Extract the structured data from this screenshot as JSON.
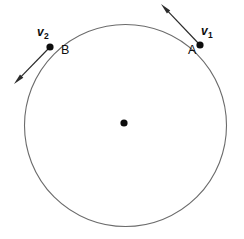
{
  "figure": {
    "background_color": "#ffffff",
    "stroke_color": "#6b6b6b",
    "marker_color": "#0d0d0d",
    "width": 244,
    "height": 239
  },
  "circle": {
    "name": "circular-path",
    "center_x": 125.5,
    "center_y": 125.5,
    "radius": 101,
    "stroke_width": 1.1,
    "stroke_color": "#6b6b6b",
    "fill": "none"
  },
  "center_point": {
    "label": "",
    "x": 124,
    "y": 123,
    "radius": 3.6,
    "color": "#0d0d0d"
  },
  "points": [
    {
      "id": "A",
      "label": "A",
      "x": 200,
      "y": 45,
      "radius": 3.6,
      "color": "#0d0d0d",
      "label_x": 188,
      "label_y": 44
    },
    {
      "id": "B",
      "label": "B",
      "x": 50,
      "y": 47,
      "radius": 3.6,
      "color": "#0d0d0d",
      "label_x": 61,
      "label_y": 44
    }
  ],
  "vectors": [
    {
      "id": "v1",
      "label": "v",
      "subscript": "1",
      "from_x": 200,
      "from_y": 45,
      "to_x": 161,
      "to_y": 4,
      "label_x": 201,
      "label_y": 25,
      "stroke_color": "#2b2b2b",
      "stroke_width": 1.2,
      "head_length": 11,
      "head_width": 4.6
    },
    {
      "id": "v2",
      "label": "v",
      "subscript": "2",
      "from_x": 50,
      "from_y": 47,
      "to_x": 14,
      "to_y": 84,
      "label_x": 37,
      "label_y": 26,
      "stroke_color": "#2b2b2b",
      "stroke_width": 1.2,
      "head_length": 11,
      "head_width": 4.6
    }
  ]
}
